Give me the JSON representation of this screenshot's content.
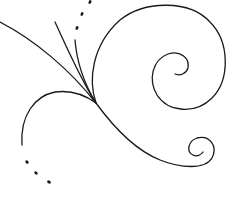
{
  "artwork": {
    "description": "Decorative swirl flourish line art",
    "colors": {
      "background": "#ffffff",
      "line": "#1a1a1a"
    },
    "stroke_width": 1.3,
    "elements": {
      "main_diagonal": "long diagonal stroke from top-left to junction",
      "large_spiral": "large spiral curling clockwise into center at right",
      "small_spiral": "small spiral curl at bottom right",
      "left_arc": "arc curving down to the left",
      "upper_strands": "short strands rising from junction",
      "dots_top": 3,
      "dots_bottom_left": 3
    }
  }
}
